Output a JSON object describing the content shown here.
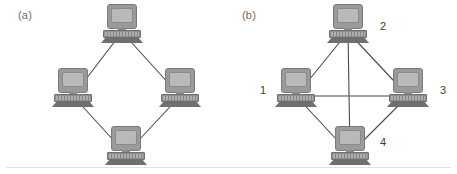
{
  "figure": {
    "width": 457,
    "height": 174,
    "background": "#ffffff",
    "divider_color": "#e2e2e2"
  },
  "panels": [
    {
      "id": "a",
      "label": "(a)",
      "topology": "ring",
      "node_icon": "computer-icon",
      "nodes": [
        {
          "id": "a-top",
          "label": "",
          "x": 122,
          "y": 24
        },
        {
          "id": "a-left",
          "label": "",
          "x": 73,
          "y": 88
        },
        {
          "id": "a-right",
          "label": "",
          "x": 180,
          "y": 88
        },
        {
          "id": "a-bottom",
          "label": "",
          "x": 126,
          "y": 146
        }
      ],
      "edges": [
        {
          "from": "a-top",
          "to": "a-left"
        },
        {
          "from": "a-top",
          "to": "a-right"
        },
        {
          "from": "a-left",
          "to": "a-bottom"
        },
        {
          "from": "a-right",
          "to": "a-bottom"
        }
      ]
    },
    {
      "id": "b",
      "label": "(b)",
      "topology": "full-mesh",
      "node_icon": "computer-icon",
      "nodes": [
        {
          "id": "b-2",
          "label": "2",
          "x": 120,
          "y": 24,
          "label_dx": 32,
          "label_dy": -4
        },
        {
          "id": "b-1",
          "label": "1",
          "x": 68,
          "y": 88,
          "label_dx": -36,
          "label_dy": -4
        },
        {
          "id": "b-3",
          "label": "3",
          "x": 180,
          "y": 88,
          "label_dx": 32,
          "label_dy": -4
        },
        {
          "id": "b-4",
          "label": "4",
          "x": 122,
          "y": 146,
          "label_dx": 30,
          "label_dy": -10
        }
      ],
      "edges": [
        {
          "from": "b-1",
          "to": "b-2"
        },
        {
          "from": "b-2",
          "to": "b-3"
        },
        {
          "from": "b-1",
          "to": "b-4"
        },
        {
          "from": "b-3",
          "to": "b-4"
        },
        {
          "from": "b-1",
          "to": "b-3"
        },
        {
          "from": "b-2",
          "to": "b-4"
        }
      ]
    }
  ],
  "style": {
    "edge_color": "#4a4a4a",
    "panel_label_color": "#6e6e6e",
    "node_label_color": "#3d3d3d",
    "monitor_bezel": "#9a9a9a",
    "monitor_screen": "#b9b9b9",
    "base_color": "#8e8e8e"
  }
}
